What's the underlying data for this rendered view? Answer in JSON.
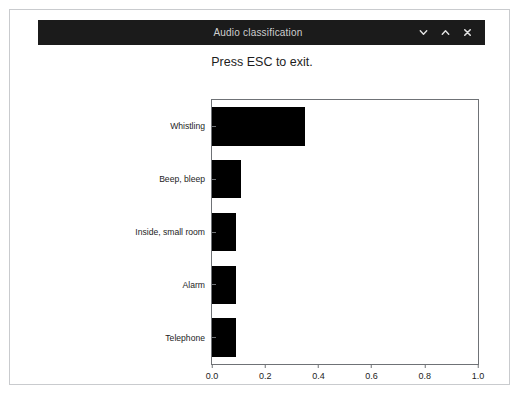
{
  "window": {
    "title": "Audio classification",
    "buttons": [
      {
        "name": "minimize-button",
        "icon": "chevron-down-icon",
        "label": "⌄"
      },
      {
        "name": "maximize-button",
        "icon": "chevron-up-icon",
        "label": "⌃"
      },
      {
        "name": "close-button",
        "icon": "close-icon",
        "label": "✕"
      }
    ]
  },
  "figure": {
    "title": "Press ESC to exit."
  },
  "chart_data": {
    "type": "bar",
    "orientation": "horizontal",
    "title": "Press ESC to exit.",
    "xlabel": "",
    "ylabel": "",
    "categories": [
      "Whistling",
      "Beep, bleep",
      "Inside, small room",
      "Alarm",
      "Telephone"
    ],
    "values": [
      0.35,
      0.11,
      0.09,
      0.09,
      0.09
    ],
    "xlim": [
      0.0,
      1.0
    ],
    "xticks": [
      "0.0",
      "0.2",
      "0.4",
      "0.6",
      "0.8",
      "1.0"
    ],
    "xtick_values": [
      0.0,
      0.2,
      0.4,
      0.6,
      0.8,
      1.0
    ],
    "grid": false,
    "legend": false,
    "bar_color": "#000000",
    "background": "#ffffff"
  }
}
